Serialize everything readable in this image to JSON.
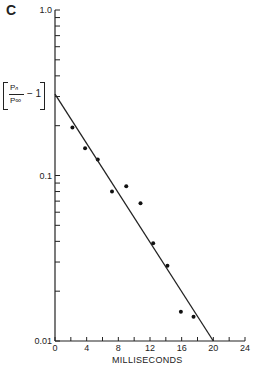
{
  "panel_label": "C",
  "ylabel": {
    "numerator": "Pₙ",
    "denominator": "P∞",
    "minus": "− 1"
  },
  "xlabel": "MILLISECONDS",
  "chart_data": {
    "type": "scatter",
    "title": "C",
    "xlabel": "MILLISECONDS",
    "ylabel": "[Pn/P∞ − 1]",
    "yscale": "log",
    "xlim": [
      0,
      24
    ],
    "ylim": [
      0.01,
      1.0
    ],
    "xticks": [
      0,
      4,
      8,
      12,
      16,
      20,
      24
    ],
    "yticks": [
      0.01,
      0.1,
      1.0
    ],
    "ytick_labels": [
      "0.01",
      "0.1",
      "1.0"
    ],
    "grid": false,
    "series": [
      {
        "name": "data",
        "type": "scatter",
        "x": [
          2.2,
          3.8,
          5.4,
          7.2,
          9.0,
          10.8,
          12.4,
          14.2,
          15.9,
          17.5
        ],
        "y": [
          0.195,
          0.146,
          0.125,
          0.08,
          0.086,
          0.068,
          0.039,
          0.0285,
          0.015,
          0.014
        ]
      },
      {
        "name": "fit",
        "type": "line",
        "x": [
          0,
          20
        ],
        "y": [
          0.31,
          0.01
        ]
      }
    ]
  }
}
